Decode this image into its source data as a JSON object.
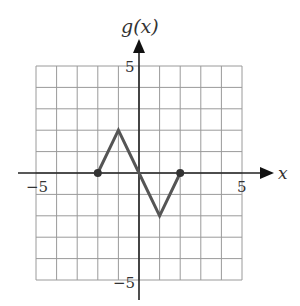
{
  "chart_data": {
    "type": "line",
    "title": "",
    "xlabel": "x",
    "ylabel": "g(x)",
    "xlim": [
      -5,
      5
    ],
    "ylim": [
      -5,
      5
    ],
    "grid": true,
    "x_ticks_labeled": [
      -5,
      5
    ],
    "y_ticks_labeled": [
      5,
      -5
    ],
    "tick_labels": {
      "x_neg": "−5",
      "x_pos": "5",
      "y_pos": "5",
      "y_neg": "−5"
    },
    "series": [
      {
        "name": "g(x)",
        "x": [
          -2,
          -1,
          0,
          1,
          2
        ],
        "y": [
          0,
          2,
          0,
          -2,
          0
        ],
        "endpoints": [
          [
            -2,
            0
          ],
          [
            2,
            0
          ]
        ],
        "endpoint_style": "closed"
      }
    ],
    "colors": {
      "curve": "#555555",
      "grid": "#9a9a9a",
      "axis": "#222222"
    }
  }
}
